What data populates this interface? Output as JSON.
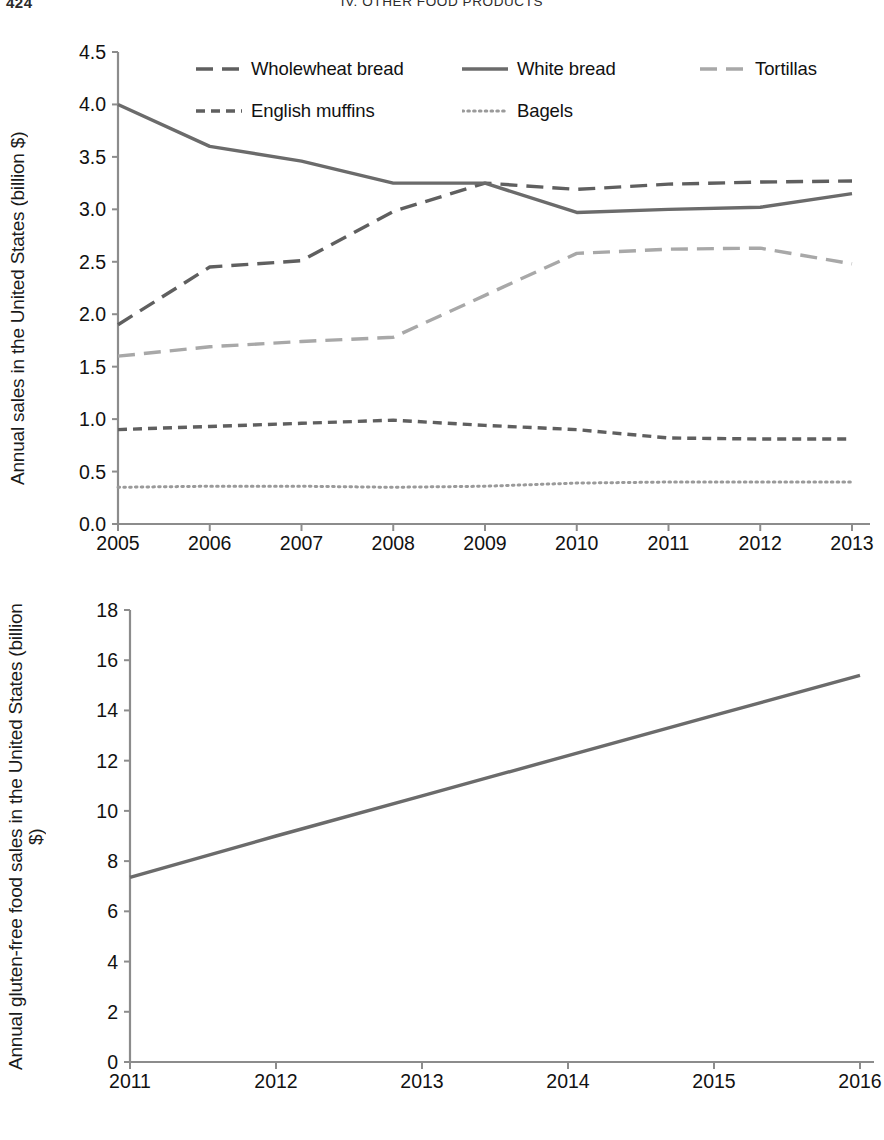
{
  "header": {
    "folio": "424",
    "section": "IV. OTHER FOOD PRODUCTS"
  },
  "colors": {
    "dark_line": "#5a5a5a",
    "mid_line": "#6b6b6b",
    "light_line": "#a8a8a8",
    "axis": "#8c8c8c",
    "text": "#111111"
  },
  "chart_data": [
    {
      "id": "bread-sales",
      "type": "line",
      "title": "",
      "xlabel": "",
      "ylabel": "Annual sales in the United States (billion $)",
      "x": [
        2005,
        2006,
        2007,
        2008,
        2009,
        2010,
        2011,
        2012,
        2013
      ],
      "xticklabels": [
        "2005",
        "2006",
        "2007",
        "2008",
        "2009",
        "2010",
        "2011",
        "2012",
        "2013"
      ],
      "yticklabels": [
        "0.0",
        "0.5",
        "1.0",
        "1.5",
        "2.0",
        "2.5",
        "3.0",
        "3.5",
        "4.0",
        "4.5"
      ],
      "yticks": [
        0.0,
        0.5,
        1.0,
        1.5,
        2.0,
        2.5,
        3.0,
        3.5,
        4.0,
        4.5
      ],
      "ylim": [
        0.0,
        4.5
      ],
      "xlim": [
        2005,
        2013
      ],
      "grid": false,
      "legend_position": "top-inside",
      "series": [
        {
          "name": "Wholewheat bread",
          "style": "long-dash",
          "color": "#5f5f5f",
          "values": [
            1.9,
            2.45,
            2.51,
            2.98,
            3.25,
            3.19,
            3.24,
            3.26,
            3.27
          ]
        },
        {
          "name": "White bread",
          "style": "solid",
          "color": "#6b6b6b",
          "values": [
            4.0,
            3.6,
            3.46,
            3.25,
            3.25,
            2.97,
            3.0,
            3.02,
            3.15
          ]
        },
        {
          "name": "Tortillas",
          "style": "long-dash",
          "color": "#a8a8a8",
          "values": [
            1.6,
            1.69,
            1.74,
            1.78,
            2.18,
            2.58,
            2.62,
            2.63,
            2.48
          ]
        },
        {
          "name": "English muffins",
          "style": "dash",
          "color": "#5f5f5f",
          "values": [
            0.9,
            0.93,
            0.96,
            0.99,
            0.94,
            0.9,
            0.82,
            0.81,
            0.81
          ]
        },
        {
          "name": "Bagels",
          "style": "dotted",
          "color": "#9a9a9a",
          "values": [
            0.35,
            0.36,
            0.36,
            0.35,
            0.36,
            0.39,
            0.4,
            0.4,
            0.4
          ]
        }
      ]
    },
    {
      "id": "gluten-free-sales",
      "type": "line",
      "title": "",
      "xlabel": "",
      "ylabel": "Annual gluten-free food sales in the United States (billion $)",
      "x": [
        2011,
        2012,
        2013,
        2014,
        2015,
        2016
      ],
      "xticklabels": [
        "2011",
        "2012",
        "2013",
        "2014",
        "2015",
        "2016"
      ],
      "yticklabels": [
        "0",
        "2",
        "4",
        "6",
        "8",
        "10",
        "12",
        "14",
        "16",
        "18"
      ],
      "yticks": [
        0,
        2,
        4,
        6,
        8,
        10,
        12,
        14,
        16,
        18
      ],
      "ylim": [
        0,
        18
      ],
      "xlim": [
        2011,
        2016
      ],
      "grid": false,
      "legend_position": "none",
      "series": [
        {
          "name": "Gluten-free food sales",
          "style": "solid",
          "color": "#6b6b6b",
          "values": [
            7.35,
            9.0,
            10.6,
            12.2,
            13.8,
            15.4
          ]
        }
      ]
    }
  ]
}
